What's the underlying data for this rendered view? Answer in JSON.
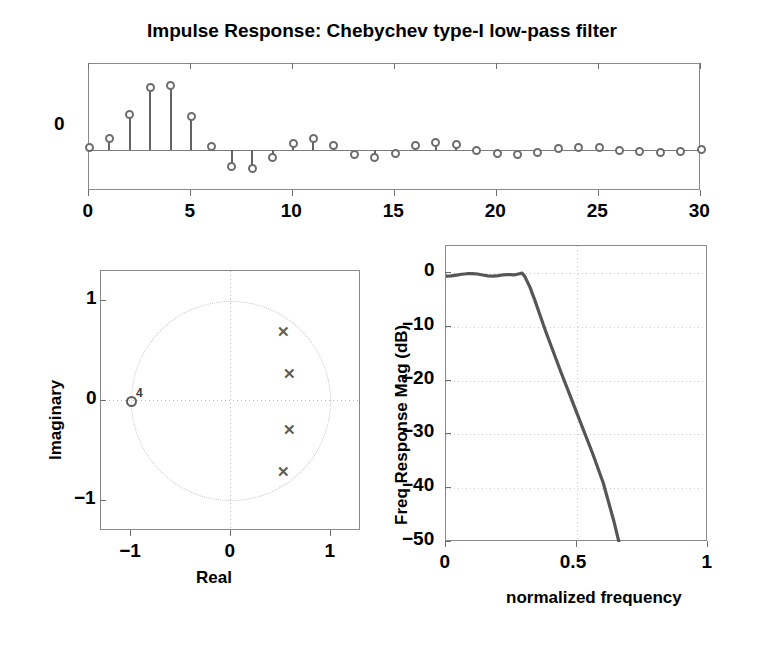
{
  "figure": {
    "title": "Impulse Response: Chebychev type-I low-pass filter"
  },
  "chart_data": [
    {
      "type": "bar",
      "name": "impulse-response-stem",
      "title": "Impulse Response: Chebychev type-I low-pass filter",
      "xlabel": "",
      "ylabel": "",
      "xlim": [
        0,
        30
      ],
      "ylim": [
        -0.26,
        0.55
      ],
      "xticks": [
        0,
        5,
        10,
        15,
        20,
        25,
        30
      ],
      "yticks": [
        0
      ],
      "ytick_labels": [
        "0"
      ],
      "grid": false,
      "categories": [
        0,
        1,
        2,
        3,
        4,
        5,
        6,
        7,
        8,
        9,
        10,
        11,
        12,
        13,
        14,
        15,
        16,
        17,
        18,
        19,
        20,
        21,
        22,
        23,
        24,
        25,
        26,
        27,
        28,
        29,
        30
      ],
      "values": [
        0.015,
        0.075,
        0.225,
        0.4,
        0.41,
        0.215,
        0.025,
        -0.105,
        -0.115,
        -0.045,
        0.045,
        0.075,
        0.03,
        -0.03,
        -0.045,
        -0.02,
        0.03,
        0.05,
        0.035,
        0.0,
        -0.02,
        -0.03,
        -0.012,
        0.008,
        0.02,
        0.015,
        0.0,
        -0.008,
        -0.012,
        -0.005,
        0.005
      ]
    },
    {
      "type": "scatter",
      "name": "pole-zero-plot",
      "title": "",
      "xlabel": "Real",
      "ylabel": "Imaginary",
      "xlim": [
        -1.3,
        1.3
      ],
      "ylim": [
        -1.3,
        1.3
      ],
      "xticks": [
        -1,
        0,
        1
      ],
      "xtick_labels": [
        "-1",
        "0",
        "1"
      ],
      "yticks": [
        -1,
        0,
        1
      ],
      "ytick_labels": [
        "1",
        "0",
        "-1"
      ],
      "grid": true,
      "unit_circle": true,
      "poles": [
        {
          "marker": "x",
          "real": 0.52,
          "imag": 0.7
        },
        {
          "marker": "x",
          "real": 0.58,
          "imag": 0.28
        },
        {
          "marker": "x",
          "real": 0.58,
          "imag": -0.28
        },
        {
          "marker": "x",
          "real": 0.52,
          "imag": -0.7
        }
      ],
      "zeros": [
        {
          "marker": "o",
          "real": -1.0,
          "imag": 0.0,
          "multiplicity": "4"
        }
      ]
    },
    {
      "type": "line",
      "name": "frequency-response",
      "title": "",
      "xlabel": "normalized frequency",
      "ylabel": "Freq Response Mag (dB)",
      "xlim": [
        0,
        1
      ],
      "ylim": [
        -50,
        5
      ],
      "xticks": [
        0,
        0.5,
        1
      ],
      "xtick_labels": [
        "0",
        "0.5",
        "1"
      ],
      "yticks": [
        0,
        -10,
        -20,
        -30,
        -40,
        -50
      ],
      "ytick_labels": [
        "0",
        "-10",
        "-20",
        "-30",
        "-40",
        "-50"
      ],
      "grid": true,
      "x": [
        0,
        0.02,
        0.04,
        0.06,
        0.08,
        0.1,
        0.12,
        0.14,
        0.16,
        0.18,
        0.2,
        0.22,
        0.24,
        0.26,
        0.28,
        0.29,
        0.3,
        0.32,
        0.34,
        0.36,
        0.38,
        0.4,
        0.44,
        0.48,
        0.52,
        0.56,
        0.6,
        0.64,
        0.66
      ],
      "y": [
        -0.6,
        -0.55,
        -0.4,
        -0.25,
        -0.15,
        -0.12,
        -0.2,
        -0.38,
        -0.55,
        -0.6,
        -0.5,
        -0.35,
        -0.3,
        -0.38,
        -0.15,
        -0.05,
        -0.6,
        -2.6,
        -5.2,
        -8.0,
        -10.8,
        -13.4,
        -18.6,
        -23.6,
        -28.6,
        -33.6,
        -39.0,
        -46.0,
        -50.0
      ]
    }
  ],
  "colors": {
    "marker": "#6d6d6d",
    "stem": "#636363",
    "curve": "#565656",
    "axis": "#8a8a8a",
    "grid": "#c2c2c2",
    "text": "#000000"
  }
}
